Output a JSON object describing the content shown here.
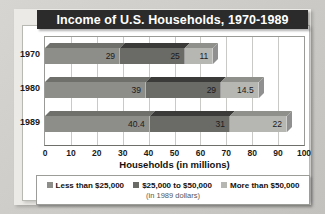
{
  "title": "Income of U.S. Households, 1970-1989",
  "legend_note": "(in 1989 dollars)",
  "xaxis_label": "Households (in millions)",
  "colors": {
    "series1": "#8d8d8a",
    "series2": "#6a6a67",
    "series3": "#b6b6b2",
    "series1_top": "#6f6f6c",
    "series2_top": "#3b3b39",
    "series3_top": "#8f8f8c",
    "series1_side": "#6b6b68",
    "series2_side": "#4a4a48",
    "series3_side": "#909090",
    "title_bg": "#2b2b2b",
    "title_fg": "#ffffff",
    "grid": "#c9c9c5",
    "panel": "#ffffff"
  },
  "chart_data": {
    "type": "bar",
    "orientation": "horizontal",
    "stacked": true,
    "title": "Income of U.S. Households, 1970-1989",
    "xlabel": "Households (in millions)",
    "ylabel": "",
    "xlim": [
      0,
      100
    ],
    "xticks": [
      0,
      10,
      20,
      30,
      40,
      50,
      60,
      70,
      80,
      90,
      100
    ],
    "xticklabels": [
      "0",
      "10",
      "20",
      "30",
      "40",
      "50",
      "60",
      "70",
      "80",
      "90",
      "100"
    ],
    "categories": [
      "1970",
      "1980",
      "1989"
    ],
    "grid": "vertical",
    "legend_position": "bottom",
    "annotation": "(in 1989 dollars)",
    "series": [
      {
        "name": "Less than $25,000",
        "color": "#8d8d8a",
        "values": [
          29,
          39,
          40.4
        ],
        "labels": [
          "29",
          "39",
          "40.4"
        ]
      },
      {
        "name": "$25,000 to $50,000",
        "color": "#6a6a67",
        "values": [
          25,
          29,
          31
        ],
        "labels": [
          "25",
          "29",
          "31"
        ]
      },
      {
        "name": "More than $50,000",
        "color": "#b6b6b2",
        "values": [
          11,
          14.5,
          22
        ],
        "labels": [
          "11",
          "14.5",
          "22"
        ]
      }
    ],
    "totals": [
      65,
      82.5,
      93.4
    ]
  }
}
